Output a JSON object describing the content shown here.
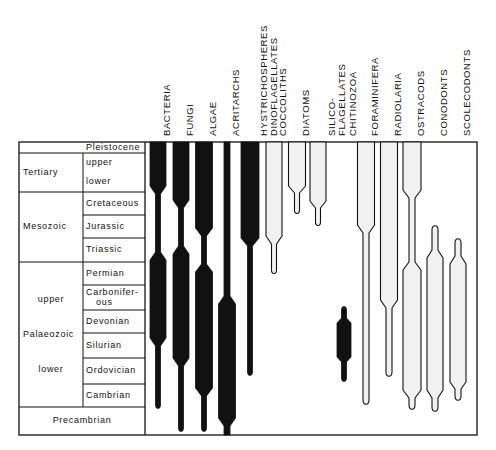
{
  "chart_data": {
    "type": "range-chart",
    "title": "",
    "colors": {
      "ink": "#111111",
      "paper": "#ffffff",
      "stipple": "#f1f1f1"
    },
    "frame": {
      "left": 19,
      "era_divider": 83,
      "label_right": 145,
      "right": 477,
      "top": 142,
      "bottom": 435
    },
    "time_scale": {
      "eras": [
        {
          "label": "Tertiary",
          "top": 153,
          "bottom": 192
        },
        {
          "label": "Mesozoic",
          "top": 192,
          "bottom": 262
        },
        {
          "label": "Palaeozoic",
          "top": 262,
          "bottom": 407,
          "sub": [
            {
              "label": "upper",
              "y": 300
            },
            {
              "label": "lower",
              "y": 370
            }
          ]
        }
      ],
      "periods": [
        {
          "label": "Pleistocene",
          "top": 142,
          "bottom": 153,
          "span": "period-only"
        },
        {
          "label": "upper",
          "top": 153,
          "bottom": 172,
          "line_below": false
        },
        {
          "label": "lower",
          "top": 172,
          "bottom": 192
        },
        {
          "label": "Cretaceous",
          "top": 192,
          "bottom": 215
        },
        {
          "label": "Jurassic",
          "top": 215,
          "bottom": 238
        },
        {
          "label": "Triassic",
          "top": 238,
          "bottom": 262
        },
        {
          "label": "Permian",
          "top": 262,
          "bottom": 285
        },
        {
          "label": "Carbonifer-\nous",
          "top": 285,
          "bottom": 310
        },
        {
          "label": "Devonian",
          "top": 310,
          "bottom": 333
        },
        {
          "label": "Silurian",
          "top": 333,
          "bottom": 358
        },
        {
          "label": "Ordovician",
          "top": 358,
          "bottom": 384
        },
        {
          "label": "Cambrian",
          "top": 384,
          "bottom": 407
        }
      ],
      "precambrian": {
        "label": "Precambrian",
        "top": 407,
        "bottom": 435
      }
    },
    "series": [
      {
        "name": "BACTERIA",
        "x": 158,
        "fill": "solid",
        "wide": 16,
        "narrow": 5,
        "segments": [
          {
            "from": 142,
            "to": 186,
            "w": "wide"
          },
          {
            "from": 194,
            "to": 252,
            "w": "narrow"
          },
          {
            "from": 260,
            "to": 338,
            "w": "wide"
          },
          {
            "from": 346,
            "to": 405,
            "w": "narrow"
          }
        ]
      },
      {
        "name": "FUNGI",
        "x": 181,
        "fill": "solid",
        "wide": 16,
        "narrow": 5,
        "segments": [
          {
            "from": 142,
            "to": 200,
            "w": "wide"
          },
          {
            "from": 208,
            "to": 246,
            "w": "narrow"
          },
          {
            "from": 254,
            "to": 358,
            "w": "wide"
          },
          {
            "from": 366,
            "to": 428,
            "w": "narrow"
          }
        ]
      },
      {
        "name": "ALGAE",
        "x": 204,
        "fill": "solid",
        "wide": 17,
        "narrow": 5,
        "segments": [
          {
            "from": 142,
            "to": 228,
            "w": "wide"
          },
          {
            "from": 236,
            "to": 264,
            "w": "narrow"
          },
          {
            "from": 272,
            "to": 388,
            "w": "wide"
          },
          {
            "from": 396,
            "to": 428,
            "w": "narrow"
          }
        ]
      },
      {
        "name": "ACRITARCHS",
        "x": 227,
        "fill": "solid",
        "wide": 17,
        "narrow": 6,
        "segments": [
          {
            "from": 142,
            "to": 296,
            "w": "narrow"
          },
          {
            "from": 304,
            "to": 418,
            "w": "wide"
          },
          {
            "from": 426,
            "to": 435,
            "w": "narrow"
          }
        ]
      },
      {
        "name": "HYSTRICHOSPHERES\nDINOFLAGELLATES",
        "x": 250,
        "fill": "solid",
        "wide": 18,
        "narrow": 5,
        "segments": [
          {
            "from": 142,
            "to": 238,
            "w": "wide"
          },
          {
            "from": 246,
            "to": 372,
            "w": "narrow"
          }
        ]
      },
      {
        "name": "COCCOLITHS",
        "x": 274,
        "fill": "outline",
        "wide": 16,
        "narrow": 5,
        "segments": [
          {
            "from": 142,
            "to": 236,
            "w": "wide"
          },
          {
            "from": 244,
            "to": 270,
            "w": "narrow"
          }
        ]
      },
      {
        "name": "DIATOMS",
        "x": 297,
        "fill": "outline",
        "wide": 17,
        "narrow": 5,
        "segments": [
          {
            "from": 142,
            "to": 186,
            "w": "wide"
          },
          {
            "from": 193,
            "to": 210,
            "w": "narrow"
          }
        ]
      },
      {
        "name": "SILICO-\nFLAGELLATES",
        "x": 318,
        "fill": "outline",
        "wide": 16,
        "narrow": 5,
        "segments": [
          {
            "from": 142,
            "to": 201,
            "w": "wide"
          },
          {
            "from": 208,
            "to": 222,
            "w": "narrow"
          }
        ]
      },
      {
        "name": "CHITINOZOA",
        "x": 344,
        "fill": "solid",
        "wide": 14,
        "narrow": 5,
        "segments": [
          {
            "from": 310,
            "to": 318,
            "w": "narrow"
          },
          {
            "from": 323,
            "to": 357,
            "w": "wide"
          },
          {
            "from": 362,
            "to": 378,
            "w": "narrow"
          }
        ]
      },
      {
        "name": "FORAMINIFERA",
        "x": 366,
        "fill": "outline",
        "wide": 17,
        "narrow": 6,
        "segments": [
          {
            "from": 142,
            "to": 225,
            "w": "wide"
          },
          {
            "from": 233,
            "to": 400,
            "w": "narrow"
          }
        ]
      },
      {
        "name": "RADIOLARIA",
        "x": 389,
        "fill": "outline",
        "wide": 17,
        "narrow": 6,
        "segments": [
          {
            "from": 142,
            "to": 300,
            "w": "wide"
          },
          {
            "from": 308,
            "to": 372,
            "w": "narrow"
          }
        ]
      },
      {
        "name": "OSTRACODS",
        "x": 412,
        "fill": "outline",
        "wide": 18,
        "narrow": 6,
        "segments": [
          {
            "from": 142,
            "to": 190,
            "w": "wide"
          },
          {
            "from": 198,
            "to": 262,
            "w": "narrow"
          },
          {
            "from": 270,
            "to": 390,
            "w": "wide"
          },
          {
            "from": 398,
            "to": 405,
            "w": "narrow"
          }
        ]
      },
      {
        "name": "CONODONTS",
        "x": 435,
        "fill": "outline",
        "wide": 16,
        "narrow": 6,
        "segments": [
          {
            "from": 230,
            "to": 250,
            "w": "narrow"
          },
          {
            "from": 258,
            "to": 390,
            "w": "wide"
          },
          {
            "from": 398,
            "to": 407,
            "w": "narrow"
          }
        ]
      },
      {
        "name": "SCOLECODONTS",
        "x": 458,
        "fill": "outline",
        "wide": 16,
        "narrow": 6,
        "segments": [
          {
            "from": 243,
            "to": 256,
            "w": "narrow"
          },
          {
            "from": 264,
            "to": 382,
            "w": "wide"
          },
          {
            "from": 389,
            "to": 396,
            "w": "narrow"
          }
        ]
      }
    ],
    "legend": null,
    "grid": false
  },
  "labels": {
    "columns": [
      {
        "lines": [
          "BACTERIA"
        ]
      },
      {
        "lines": [
          "FUNGI"
        ]
      },
      {
        "lines": [
          "ALGAE"
        ]
      },
      {
        "lines": [
          "ACRITARCHS"
        ]
      },
      {
        "lines": [
          "HYSTRICHOSPHERES",
          "DINOFLAGELLATES"
        ]
      },
      {
        "lines": [
          "COCCOLITHS"
        ]
      },
      {
        "lines": [
          "DIATOMS"
        ]
      },
      {
        "lines": [
          "SILICO-",
          "FLAGELLATES"
        ]
      },
      {
        "lines": [
          "CHITINOZOA"
        ]
      },
      {
        "lines": [
          "FORAMINIFERA"
        ]
      },
      {
        "lines": [
          "RADIOLARIA"
        ]
      },
      {
        "lines": [
          "OSTRACODS"
        ]
      },
      {
        "lines": [
          "CONODONTS"
        ]
      },
      {
        "lines": [
          "SCOLECODONTS"
        ]
      }
    ]
  }
}
